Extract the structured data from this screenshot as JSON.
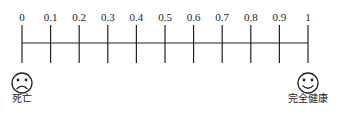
{
  "scale": {
    "min": 0,
    "max": 1,
    "ticks": [
      "0",
      "0.1",
      "0.2",
      "0.3",
      "0.4",
      "0.5",
      "0.6",
      "0.7",
      "0.8",
      "0.9",
      "1"
    ],
    "line_color": "#222222"
  },
  "endpoints": {
    "left": {
      "icon": "sad-face-icon",
      "label": "死亡"
    },
    "right": {
      "icon": "happy-face-icon",
      "label": "完全健康"
    }
  }
}
